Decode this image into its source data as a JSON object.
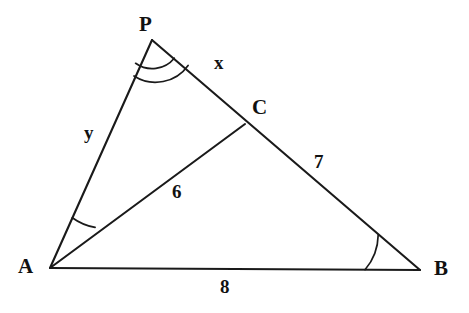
{
  "figure": {
    "type": "geometry-diagram",
    "background_color": "#ffffff",
    "stroke_color": "#1a1a1a",
    "vertices": [
      {
        "name": "P",
        "label": "P",
        "x": 152,
        "y": 40,
        "label_x": 139,
        "label_y": 14
      },
      {
        "name": "A",
        "label": "A",
        "x": 50,
        "y": 268,
        "label_x": 18,
        "label_y": 256
      },
      {
        "name": "B",
        "label": "B",
        "x": 420,
        "y": 270,
        "label_x": 434,
        "label_y": 258
      },
      {
        "name": "C",
        "label": "C",
        "x": 245,
        "y": 124,
        "label_x": 252,
        "label_y": 97
      }
    ],
    "segments": [
      {
        "name": "segment-PA",
        "from": "P",
        "to": "A",
        "label": "y",
        "label_x": 84,
        "label_y": 123
      },
      {
        "name": "segment-PC",
        "from": "P",
        "to": "C",
        "label": "x",
        "label_x": 214,
        "label_y": 53
      },
      {
        "name": "segment-CB",
        "from": "C",
        "to": "B",
        "label": "7",
        "label_x": 314,
        "label_y": 152
      },
      {
        "name": "segment-AC",
        "from": "A",
        "to": "C",
        "label": "6",
        "label_x": 172,
        "label_y": 182
      },
      {
        "name": "segment-AB",
        "from": "A",
        "to": "B",
        "label": "8",
        "label_x": 220,
        "label_y": 277
      }
    ],
    "angle_marks": [
      {
        "name": "angle-mark-P",
        "vertex": "P",
        "arcs": 2,
        "radii": [
          25,
          37
        ]
      },
      {
        "name": "angle-mark-A",
        "vertex": "A",
        "arcs": 1,
        "radii": [
          55
        ]
      },
      {
        "name": "angle-mark-B",
        "vertex": "B",
        "arcs": 1,
        "radii": [
          55
        ]
      }
    ],
    "labels": {
      "P": "P",
      "A": "A",
      "B": "B",
      "C": "C",
      "x": "x",
      "y": "y",
      "six": "6",
      "seven": "7",
      "eight": "8"
    }
  }
}
